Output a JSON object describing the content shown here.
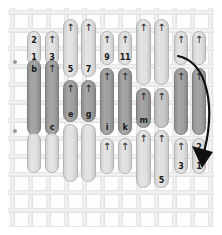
{
  "diagram": {
    "background": "woven-grid",
    "colors": {
      "grid_line": "#ececec",
      "rod_light": "#e0e0e0",
      "rod_mid": "#c6c6c6",
      "rod_dark": "#a0a0a0",
      "marker_dot": "#9a9a9a",
      "label_text": "#1a1a1a",
      "arrow": "#1a1a1a"
    },
    "arrow_glyph": "↑",
    "markers": [
      {
        "name": "left-marker-upper",
        "x": 13,
        "y": 60
      },
      {
        "name": "left-marker-lower",
        "x": 13,
        "y": 129
      }
    ],
    "curved_arrow": {
      "name": "flow-arrow",
      "direction": "down-right-curve"
    },
    "rods": [
      {
        "col": 1,
        "band": "top",
        "x": 27,
        "y": 31,
        "w": 14,
        "h": 34,
        "tone": "light",
        "top_label": "2",
        "bottom_label": "1",
        "arrow": false
      },
      {
        "col": 1,
        "band": "middle",
        "x": 27,
        "y": 60,
        "w": 14,
        "h": 75,
        "tone": "dark",
        "top_label": "b",
        "bottom_label": "",
        "arrow": false
      },
      {
        "col": 1,
        "band": "bottom",
        "x": 27,
        "y": 133,
        "w": 14,
        "h": 40,
        "tone": "light",
        "top_label": "",
        "bottom_label": "",
        "arrow": false
      },
      {
        "col": 2,
        "band": "top",
        "x": 45,
        "y": 31,
        "w": 14,
        "h": 34,
        "tone": "light",
        "top_label": "",
        "bottom_label": "3",
        "arrow": true
      },
      {
        "col": 2,
        "band": "middle",
        "x": 45,
        "y": 60,
        "w": 14,
        "h": 75,
        "tone": "dark",
        "top_label": "",
        "bottom_label": "c",
        "arrow": true
      },
      {
        "col": 2,
        "band": "bottom",
        "x": 45,
        "y": 133,
        "w": 14,
        "h": 40,
        "tone": "light",
        "top_label": "",
        "bottom_label": "",
        "arrow": false
      },
      {
        "col": 3,
        "band": "top",
        "x": 63,
        "y": 19,
        "w": 15,
        "h": 58,
        "tone": "light",
        "top_label": "",
        "bottom_label": "5",
        "arrow": true
      },
      {
        "col": 3,
        "band": "middle",
        "x": 63,
        "y": 80,
        "w": 15,
        "h": 42,
        "tone": "dark",
        "top_label": "",
        "bottom_label": "e",
        "arrow": true
      },
      {
        "col": 3,
        "band": "bottom",
        "x": 63,
        "y": 124,
        "w": 15,
        "h": 58,
        "tone": "light",
        "top_label": "",
        "bottom_label": "",
        "arrow": false
      },
      {
        "col": 4,
        "band": "top",
        "x": 81,
        "y": 19,
        "w": 15,
        "h": 58,
        "tone": "light",
        "top_label": "",
        "bottom_label": "7",
        "arrow": true
      },
      {
        "col": 4,
        "band": "middle",
        "x": 81,
        "y": 80,
        "w": 15,
        "h": 42,
        "tone": "dark",
        "top_label": "",
        "bottom_label": "g",
        "arrow": true
      },
      {
        "col": 4,
        "band": "bottom",
        "x": 81,
        "y": 124,
        "w": 15,
        "h": 58,
        "tone": "light",
        "top_label": "",
        "bottom_label": "",
        "arrow": false
      },
      {
        "col": 5,
        "band": "top",
        "x": 100,
        "y": 31,
        "w": 14,
        "h": 34,
        "tone": "light",
        "top_label": "",
        "bottom_label": "9",
        "arrow": true
      },
      {
        "col": 5,
        "band": "middle",
        "x": 100,
        "y": 68,
        "w": 14,
        "h": 67,
        "tone": "dark",
        "top_label": "",
        "bottom_label": "i",
        "arrow": true
      },
      {
        "col": 5,
        "band": "bottom",
        "x": 100,
        "y": 138,
        "w": 14,
        "h": 36,
        "tone": "light",
        "top_label": "",
        "bottom_label": "",
        "arrow": true
      },
      {
        "col": 6,
        "band": "top",
        "x": 118,
        "y": 31,
        "w": 14,
        "h": 34,
        "tone": "light",
        "top_label": "",
        "bottom_label": "11",
        "arrow": true
      },
      {
        "col": 6,
        "band": "middle",
        "x": 118,
        "y": 68,
        "w": 14,
        "h": 67,
        "tone": "dark",
        "top_label": "",
        "bottom_label": "k",
        "arrow": true
      },
      {
        "col": 6,
        "band": "bottom",
        "x": 118,
        "y": 138,
        "w": 14,
        "h": 36,
        "tone": "light",
        "top_label": "",
        "bottom_label": "",
        "arrow": true
      },
      {
        "col": 7,
        "band": "top",
        "x": 136,
        "y": 19,
        "w": 15,
        "h": 66,
        "tone": "light",
        "top_label": "",
        "bottom_label": "",
        "arrow": true
      },
      {
        "col": 7,
        "band": "middle",
        "x": 136,
        "y": 88,
        "w": 15,
        "h": 40,
        "tone": "dark",
        "top_label": "",
        "bottom_label": "m",
        "arrow": true
      },
      {
        "col": 7,
        "band": "bottom",
        "x": 136,
        "y": 130,
        "w": 15,
        "h": 58,
        "tone": "light",
        "top_label": "",
        "bottom_label": "",
        "arrow": true
      },
      {
        "col": 8,
        "band": "top",
        "x": 154,
        "y": 19,
        "w": 15,
        "h": 66,
        "tone": "light",
        "top_label": "",
        "bottom_label": "",
        "arrow": true
      },
      {
        "col": 8,
        "band": "middle",
        "x": 154,
        "y": 88,
        "w": 15,
        "h": 40,
        "tone": "mid",
        "top_label": "",
        "bottom_label": "",
        "arrow": true
      },
      {
        "col": 8,
        "band": "bottom",
        "x": 154,
        "y": 130,
        "w": 15,
        "h": 58,
        "tone": "light",
        "top_label": "",
        "bottom_label": "5",
        "arrow": true
      },
      {
        "col": 9,
        "band": "top",
        "x": 174,
        "y": 31,
        "w": 14,
        "h": 34,
        "tone": "light",
        "top_label": "",
        "bottom_label": "",
        "arrow": true
      },
      {
        "col": 9,
        "band": "middle",
        "x": 174,
        "y": 68,
        "w": 14,
        "h": 67,
        "tone": "dark",
        "top_label": "",
        "bottom_label": "",
        "arrow": true
      },
      {
        "col": 9,
        "band": "bottom",
        "x": 174,
        "y": 138,
        "w": 14,
        "h": 36,
        "tone": "light",
        "top_label": "",
        "bottom_label": "3",
        "arrow": true
      },
      {
        "col": 10,
        "band": "top",
        "x": 192,
        "y": 31,
        "w": 14,
        "h": 34,
        "tone": "light",
        "top_label": "",
        "bottom_label": "",
        "arrow": true
      },
      {
        "col": 10,
        "band": "middle",
        "x": 192,
        "y": 68,
        "w": 14,
        "h": 67,
        "tone": "dark",
        "top_label": "",
        "bottom_label": "",
        "arrow": true
      },
      {
        "col": 10,
        "band": "bottom",
        "x": 192,
        "y": 138,
        "w": 14,
        "h": 36,
        "tone": "light",
        "top_label": "2",
        "bottom_label": "1",
        "arrow": false
      }
    ]
  }
}
